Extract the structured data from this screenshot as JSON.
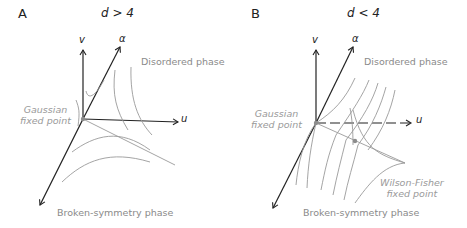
{
  "panels": [
    {
      "id": "A",
      "letter": "A",
      "condition": "d > 4",
      "axes": {
        "v": "v",
        "alpha": "α",
        "u": "u"
      },
      "labels": {
        "disordered": "Disordered phase",
        "broken": "Broken-symmetry phase",
        "gaussian_line1": "Gaussian",
        "gaussian_line2": "fixed point"
      }
    },
    {
      "id": "B",
      "letter": "B",
      "condition": "d < 4",
      "axes": {
        "v": "v",
        "alpha": "α",
        "u": "u"
      },
      "labels": {
        "disordered": "Disordered phase",
        "broken": "Broken-symmetry phase",
        "gaussian_line1": "Gaussian",
        "gaussian_line2": "fixed point",
        "wf_line1": "Wilson-Fisher",
        "wf_line2": "fixed point"
      }
    }
  ],
  "colors": {
    "axis": "#222222",
    "flow": "#9a9a9a",
    "label": "#8a8a8a",
    "fixed_point": "#8c8c8c"
  }
}
